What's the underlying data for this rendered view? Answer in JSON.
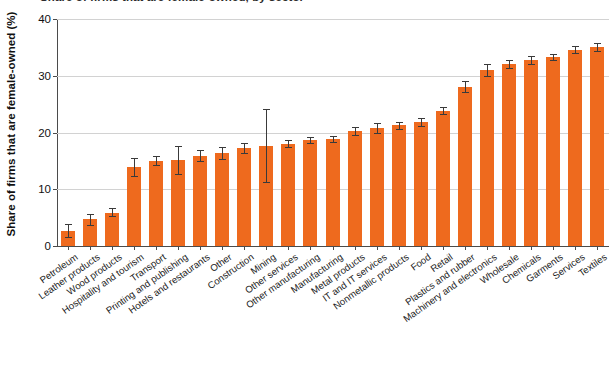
{
  "chart_data": {
    "type": "bar",
    "title": "Share of firms that are female-owned, by sector",
    "subtitle": "",
    "xlabel": "",
    "ylabel": "Share of firms that are female-owned (%)",
    "ylim": [
      0,
      40
    ],
    "yticks": [
      0,
      10,
      20,
      30,
      40
    ],
    "ytick_labels": [
      "0",
      "10",
      "20",
      "30",
      "40"
    ],
    "grid": "horizontal",
    "legend": "none",
    "bar_color": "#ee6a1e",
    "error_bar_color": "#3a3a3a",
    "axis_color": "#4b4b4b",
    "gridline_color": "#d2d2d2",
    "categories": [
      "Petroleum",
      "Leather products",
      "Wood products",
      "Hospitality and tourism",
      "Transport",
      "Printing and publishing",
      "Hotels and restaurants",
      "Other",
      "Construction",
      "Mining",
      "Other services",
      "Other manufacturing",
      "Manufacturing",
      "Metal products",
      "IT and IT services",
      "Nonmetallic products",
      "Food",
      "Retail",
      "Plastics and rubber",
      "Machinery and electronics",
      "Wholesale",
      "Chemicals",
      "Garments",
      "Services",
      "Textiles"
    ],
    "values": [
      2.7,
      4.7,
      5.9,
      13.9,
      15.0,
      15.1,
      15.9,
      16.4,
      17.2,
      17.6,
      18.0,
      18.6,
      18.8,
      20.2,
      20.8,
      21.3,
      21.9,
      23.8,
      28.1,
      31.0,
      32.0,
      32.7,
      33.3,
      34.6,
      35.1
    ],
    "error_low": [
      1.5,
      3.7,
      5.2,
      12.3,
      14.2,
      12.6,
      14.9,
      15.4,
      16.4,
      11.3,
      17.5,
      18.1,
      18.3,
      19.5,
      19.9,
      20.7,
      21.2,
      23.2,
      27.2,
      30.0,
      31.3,
      32.0,
      32.7,
      34.0,
      34.4
    ],
    "error_high": [
      3.9,
      5.7,
      6.7,
      15.5,
      15.9,
      17.6,
      16.9,
      17.4,
      18.1,
      24.1,
      18.6,
      19.2,
      19.4,
      21.0,
      21.7,
      21.9,
      22.6,
      24.5,
      29.1,
      32.0,
      32.7,
      33.4,
      33.9,
      35.2,
      35.8
    ]
  }
}
